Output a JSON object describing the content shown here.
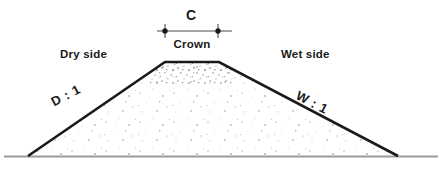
{
  "diagram": {
    "type": "engineering-cross-section",
    "labels": {
      "crown_dimension": "C",
      "crown": "Crown",
      "dry_side": "Dry side",
      "wet_side": "Wet side",
      "dry_slope_ratio": "D : 1",
      "wet_slope_ratio": "W : 1"
    },
    "colors": {
      "outline": "#1a1a1a",
      "ground_line": "#9a9a9a",
      "fill": "#ffffff",
      "stipple": "#b9b9b9",
      "stipple_dense": "#8d8d8d",
      "dimension_line": "#4a4a4a",
      "text": "#1a1a1a"
    },
    "geometry": {
      "left_toe": [
        28,
        156
      ],
      "left_crown": [
        165,
        62
      ],
      "right_crown": [
        219,
        62
      ],
      "right_toe": [
        398,
        156
      ],
      "ground_line_y": 156,
      "ground_line_x_start": 4,
      "ground_line_x_end": 438,
      "outline_width": 2.5
    },
    "dimension": {
      "line_y": 31,
      "line_x_start": 157,
      "line_x_end": 232,
      "tick_x_left": 165,
      "tick_x_right": 218,
      "tick_half_height": 7,
      "dot_radius": 2.6
    }
  }
}
